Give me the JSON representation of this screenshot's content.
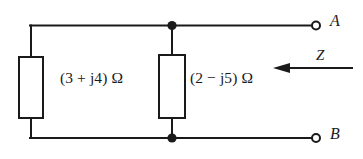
{
  "diagram": {
    "type": "circuit-schematic",
    "background_color": "#ffffff",
    "line_color": "#1a1a1a",
    "text_color": "#1a1a1a",
    "components": {
      "impedance_left": {
        "label": "(3 + j4) Ω",
        "resistance": 3,
        "reactance": 4,
        "sign": "+",
        "unit": "Ω"
      },
      "impedance_right": {
        "label": "(2 − j5) Ω",
        "resistance": 2,
        "reactance": 5,
        "sign": "−",
        "unit": "Ω"
      }
    },
    "terminals": {
      "top": "A",
      "bottom": "B"
    },
    "annotations": {
      "impedance_symbol": "Z",
      "arrow_direction": "left"
    }
  }
}
